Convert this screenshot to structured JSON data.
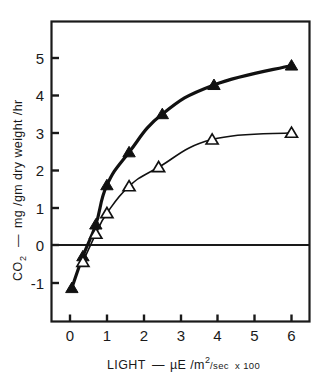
{
  "chart_data": {
    "type": "line",
    "title": "",
    "xlabel": "LIGHT — µE /m²/sec x 100",
    "ylabel": "CO₂ — mg /gm dry weight /hr",
    "xlim": [
      -0.22,
      6.45
    ],
    "ylim": [
      -1.62,
      5.72
    ],
    "xticks": [
      0,
      1,
      2,
      3,
      4,
      5,
      6
    ],
    "xtick_labels": [
      "0",
      "1",
      "2",
      "3",
      "4",
      "5",
      "6"
    ],
    "yticks": [
      -1,
      0,
      1,
      2,
      3,
      4,
      5
    ],
    "ytick_labels": [
      "-1",
      "0",
      "1",
      "2",
      "3",
      "4",
      "5"
    ],
    "grid": false,
    "legend": "none",
    "zero_line": 0,
    "series": [
      {
        "name": "filled-triangle-series",
        "marker": "filled-triangle",
        "line_width": 3.2,
        "color": "#111111",
        "points": [
          {
            "x": 0.05,
            "y": -1.15
          },
          {
            "x": 0.35,
            "y": -0.3
          },
          {
            "x": 0.7,
            "y": 0.55
          },
          {
            "x": 1.0,
            "y": 1.6
          },
          {
            "x": 1.6,
            "y": 2.48
          },
          {
            "x": 2.5,
            "y": 3.5
          },
          {
            "x": 3.9,
            "y": 4.28
          },
          {
            "x": 6.0,
            "y": 4.8
          }
        ]
      },
      {
        "name": "open-triangle-series",
        "marker": "open-triangle",
        "line_width": 1.6,
        "color": "#111111",
        "points": [
          {
            "x": 0.35,
            "y": -0.45
          },
          {
            "x": 0.7,
            "y": 0.3
          },
          {
            "x": 1.0,
            "y": 0.85
          },
          {
            "x": 1.6,
            "y": 1.57
          },
          {
            "x": 2.4,
            "y": 2.08
          },
          {
            "x": 3.85,
            "y": 2.82
          },
          {
            "x": 6.0,
            "y": 3.0
          }
        ]
      }
    ]
  },
  "axes": {
    "x_title_parts": {
      "light": "LIGHT",
      "dash": "—",
      "mu_e": "µE /m",
      "exp": "2",
      "per_sec": "/sec",
      "x100": "x 100"
    },
    "y_title_parts": {
      "co": "CO",
      "sub2": "2",
      "dash": "—",
      "units": "mg /gm dry weight /hr"
    }
  }
}
